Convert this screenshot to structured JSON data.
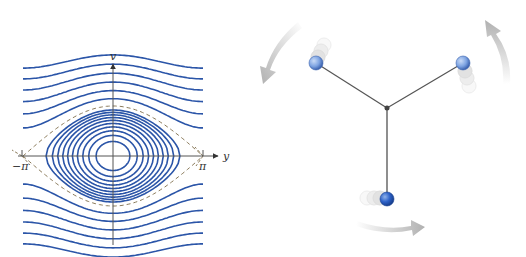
{
  "phase_portrait": {
    "x_axis_label": "y",
    "y_axis_label": "v",
    "tick_left": "−π",
    "tick_right": "π",
    "closed_orbit_count": 10,
    "open_curves_per_side": 6,
    "curve_color": "#2b55a8",
    "separatrix_color": "#8a7a5a",
    "axis_color": "#555555"
  },
  "rotor": {
    "arm_count": 3,
    "arm_color": "#555555",
    "ball_color": "#4a7fd4",
    "ball_light_color": "#8fb2ea",
    "arrow_color": "#b8b8b8",
    "rotation_direction": "counterclockwise"
  }
}
